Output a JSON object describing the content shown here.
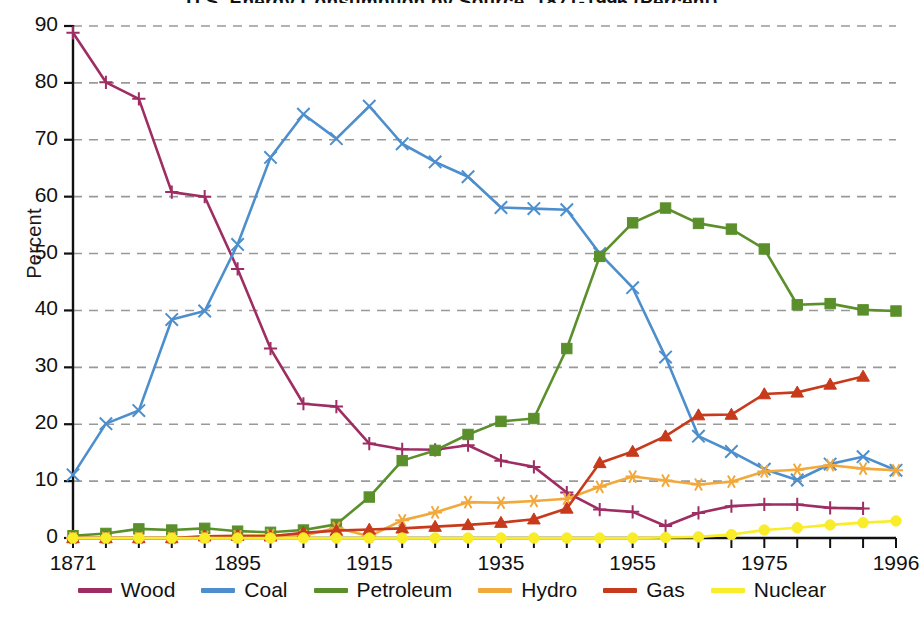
{
  "chart_data": {
    "type": "line",
    "title": "U.S. Energy Consumption by Source, 1871-1996 (Percent)",
    "xlabel": "",
    "ylabel": "Percent",
    "ylim": [
      0,
      90
    ],
    "ytick_step": 10,
    "yticks": [
      "0",
      "10",
      "20",
      "30",
      "40",
      "50",
      "60",
      "70",
      "80",
      "90"
    ],
    "xlim": [
      1871,
      1996
    ],
    "xticks_labeled": [
      "1871",
      "1895",
      "1915",
      "1935",
      "1955",
      "1975",
      "1996"
    ],
    "grid": "horizontal-dashed",
    "legend_position": "bottom",
    "x": [
      1871,
      1876,
      1881,
      1886,
      1891,
      1896,
      1901,
      1906,
      1911,
      1916,
      1921,
      1926,
      1931,
      1936,
      1941,
      1946,
      1951,
      1956,
      1961,
      1966,
      1971,
      1976,
      1981,
      1986,
      1991,
      1996
    ],
    "series": [
      {
        "name": "Wood",
        "color": "#9e2d63",
        "marker": "plus",
        "values": [
          88.8,
          80.1,
          77.2,
          60.8,
          60.0,
          47.3,
          33.3,
          23.6,
          23.1,
          16.6,
          15.6,
          15.5,
          16.3,
          13.6,
          12.5,
          8.0,
          5.0,
          4.6,
          2.1,
          4.4,
          5.6,
          5.9,
          5.9,
          5.3,
          5.2,
          null
        ]
      },
      {
        "name": "Coal",
        "color": "#4d8fcc",
        "marker": "cross",
        "values": [
          11.1,
          20.1,
          22.4,
          38.4,
          39.9,
          51.6,
          66.9,
          74.5,
          70.2,
          75.9,
          69.3,
          66.1,
          63.5,
          58.1,
          57.9,
          57.7,
          50.0,
          44.0,
          31.8,
          17.9,
          15.2,
          12.1,
          10.2,
          13.0,
          14.3,
          11.9
        ]
      },
      {
        "name": "Petroleum",
        "color": "#5a8f2b",
        "marker": "square",
        "values": [
          0.4,
          0.8,
          1.6,
          1.4,
          1.7,
          1.2,
          1.0,
          1.4,
          2.4,
          7.2,
          13.6,
          15.4,
          18.2,
          20.5,
          21.0,
          33.3,
          49.5,
          55.4,
          58.0,
          55.3,
          54.3,
          50.8,
          41.0,
          41.2,
          40.1,
          39.9
        ]
      },
      {
        "name": "Hydro",
        "color": "#f2a93b",
        "marker": "asterisk",
        "values": [
          0.0,
          0.0,
          0.0,
          0.0,
          0.2,
          0.3,
          0.5,
          0.4,
          1.8,
          0.3,
          3.1,
          4.5,
          6.3,
          6.2,
          6.5,
          6.9,
          9.0,
          10.8,
          10.1,
          9.4,
          9.9,
          11.7,
          12.0,
          12.8,
          12.2,
          11.9
        ]
      },
      {
        "name": "Gas",
        "color": "#c73a1b",
        "marker": "triangle",
        "values": [
          0.0,
          0.0,
          0.0,
          0.0,
          0.3,
          0.4,
          0.3,
          0.9,
          1.3,
          1.5,
          1.7,
          2.0,
          2.3,
          2.7,
          3.3,
          5.2,
          13.2,
          15.2,
          17.9,
          21.6,
          21.7,
          25.3,
          25.6,
          27.0,
          28.4,
          null
        ]
      },
      {
        "name": "Nuclear",
        "color": "#f9ec28",
        "marker": "circle",
        "values": [
          0.0,
          0.0,
          0.0,
          0.0,
          0.0,
          0.0,
          0.0,
          0.0,
          0.0,
          0.0,
          0.0,
          0.0,
          0.0,
          0.0,
          0.0,
          0.0,
          0.0,
          0.0,
          0.1,
          0.2,
          0.6,
          1.4,
          1.8,
          2.3,
          2.7,
          3.0
        ]
      }
    ]
  },
  "axis": {
    "ylabel": "Percent",
    "ytick_labels": [
      "90",
      "80",
      "70",
      "60",
      "50",
      "40",
      "30",
      "20",
      "10",
      "0"
    ],
    "xtick_labels": [
      "1871",
      "1895",
      "1915",
      "1935",
      "1955",
      "1975",
      "1996"
    ]
  },
  "legend": {
    "items": [
      {
        "label": "Wood",
        "color": "#9e2d63"
      },
      {
        "label": "Coal",
        "color": "#4d8fcc"
      },
      {
        "label": "Petroleum",
        "color": "#5a8f2b"
      },
      {
        "label": "Hydro",
        "color": "#f2a93b"
      },
      {
        "label": "Gas",
        "color": "#c73a1b"
      },
      {
        "label": "Nuclear",
        "color": "#f9ec28"
      }
    ]
  },
  "title": {
    "text": "U.S. Energy Consumption by Source, 1871-1996 (Percent)"
  }
}
